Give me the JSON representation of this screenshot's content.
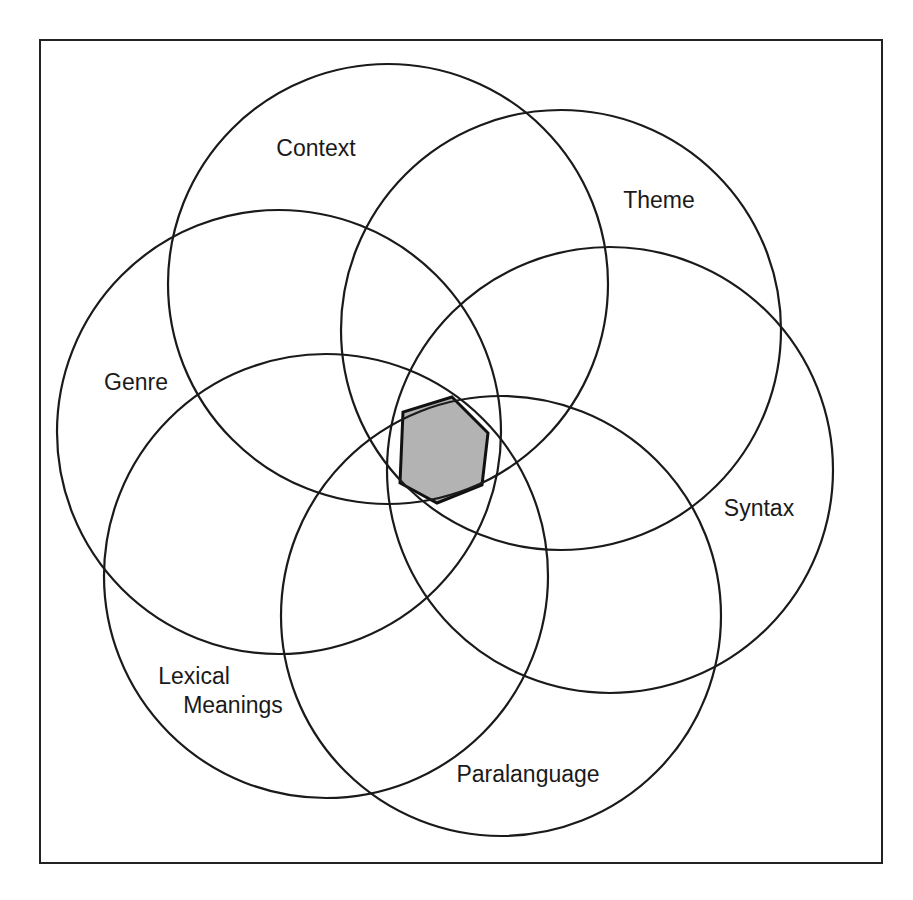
{
  "diagram": {
    "type": "overlapping-circles",
    "frame": {
      "x": 40,
      "y": 40,
      "width": 842,
      "height": 823
    },
    "circles": [
      {
        "id": "context",
        "label": "Context",
        "cx": 388,
        "cy": 284,
        "r": 220,
        "label_x": 316,
        "label_y": 156,
        "anchor": "middle"
      },
      {
        "id": "theme",
        "label": "Theme",
        "cx": 561,
        "cy": 330,
        "r": 220,
        "label_x": 659,
        "label_y": 208,
        "anchor": "middle"
      },
      {
        "id": "syntax",
        "label": "Syntax",
        "cx": 610,
        "cy": 470,
        "r": 223,
        "label_x": 759,
        "label_y": 516,
        "anchor": "middle"
      },
      {
        "id": "paralanguage",
        "label": "Paralanguage",
        "cx": 501,
        "cy": 616,
        "r": 220,
        "label_x": 528,
        "label_y": 782,
        "anchor": "middle"
      },
      {
        "id": "lexical",
        "label_lines": [
          "Lexical",
          "Meanings"
        ],
        "cx": 326,
        "cy": 576,
        "r": 222,
        "label_x": 194,
        "label_y": 684,
        "label2_x": 233,
        "label2_y": 713
      },
      {
        "id": "genre",
        "label": "Genre",
        "cx": 279,
        "cy": 432,
        "r": 222,
        "label_x": 136,
        "label_y": 390,
        "anchor": "middle"
      }
    ],
    "center_region": {
      "shape": "hexagon",
      "fill": "#b3b3b3",
      "points": "452,397 488,433 482,485 437,503 400,483 403,412"
    },
    "colors": {
      "stroke": "#1a1a1a",
      "background": "#ffffff",
      "highlight": "#b3b3b3"
    }
  }
}
